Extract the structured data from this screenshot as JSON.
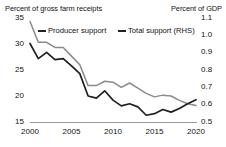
{
  "chart_data": {
    "type": "line",
    "title": "",
    "xlabel": "",
    "left_axis": {
      "label": "Percent of gross farm receipts",
      "ticks": [
        "35",
        "30",
        "25",
        "20",
        "15"
      ],
      "ylim": [
        15,
        35
      ]
    },
    "right_axis": {
      "label": "Percent of GDP",
      "ticks": [
        "1.1",
        "1.0",
        "0.9",
        "0.8",
        "0.7",
        "0.6",
        "0.5"
      ],
      "ylim": [
        0.5,
        1.1
      ]
    },
    "x_ticks": [
      "2000",
      "2005",
      "2010",
      "2015",
      "2020"
    ],
    "xlim": [
      2000,
      2020
    ],
    "grid": false,
    "legend_position": "top",
    "x": [
      2000,
      2001,
      2002,
      2003,
      2004,
      2005,
      2006,
      2007,
      2008,
      2009,
      2010,
      2011,
      2012,
      2013,
      2014,
      2015,
      2016,
      2017,
      2018,
      2019,
      2020
    ],
    "series": [
      {
        "name": "Producer support",
        "axis": "left",
        "color": "#1f1f1f",
        "values": [
          30.1,
          27.2,
          28.4,
          27.0,
          27.2,
          25.8,
          24.3,
          20.0,
          19.6,
          21.0,
          19.2,
          18.1,
          18.5,
          17.9,
          16.3,
          16.6,
          17.4,
          16.9,
          17.6,
          18.5,
          19.3
        ]
      },
      {
        "name": "Total support (RHS)",
        "axis": "right",
        "color": "#8a8a8a",
        "values": [
          1.08,
          0.96,
          0.96,
          0.93,
          0.93,
          0.88,
          0.83,
          0.71,
          0.71,
          0.735,
          0.73,
          0.7,
          0.725,
          0.695,
          0.665,
          0.645,
          0.655,
          0.65,
          0.625,
          0.605,
          0.595
        ]
      }
    ]
  },
  "legend": {
    "producer": "Producer support",
    "total": "Total support (RHS)"
  }
}
